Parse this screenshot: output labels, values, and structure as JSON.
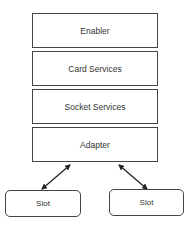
{
  "diagram": {
    "layers": [
      {
        "label": "Enabler"
      },
      {
        "label": "Card Services"
      },
      {
        "label": "Socket Services"
      },
      {
        "label": "Adapter"
      }
    ],
    "slots": [
      {
        "label": "Slot"
      },
      {
        "label": "Slot"
      }
    ],
    "connections": [
      {
        "from": "Adapter",
        "to": "Slot (left)",
        "type": "bidirectional-arrow"
      },
      {
        "from": "Adapter",
        "to": "Slot (right)",
        "type": "bidirectional-arrow"
      }
    ],
    "colors": {
      "stroke": "#444444",
      "text": "#333333",
      "background": "#ffffff"
    }
  }
}
